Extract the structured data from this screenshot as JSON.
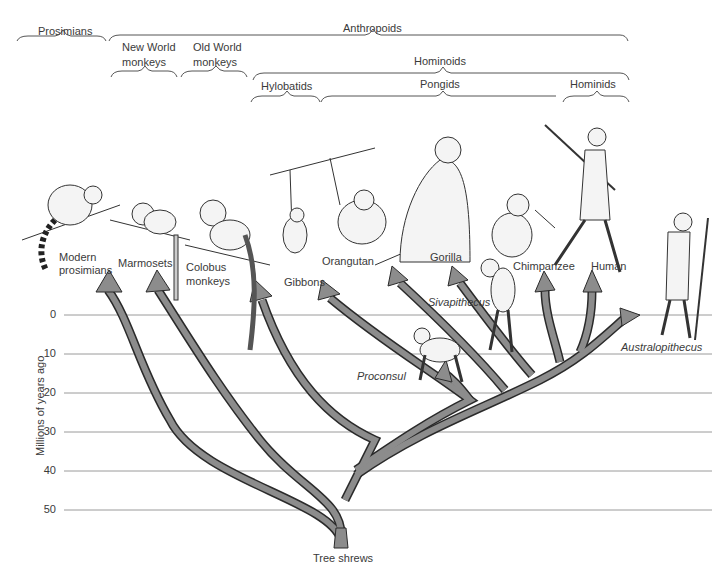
{
  "diagram": {
    "type": "phylogenetic-tree",
    "root_label": "Tree shrews",
    "axis": {
      "label": "Millions of years ago",
      "ticks": [
        "0",
        "10",
        "20",
        "30",
        "40",
        "50"
      ]
    },
    "groups": {
      "prosimians": "Prosimians",
      "anthropoids": "Anthropoids",
      "new_world_monkeys_line1": "New World",
      "new_world_monkeys_line2": "monkeys",
      "old_world_monkeys_line1": "Old World",
      "old_world_monkeys_line2": "monkeys",
      "hominoids": "Hominoids",
      "hylobatids": "Hylobatids",
      "pongids": "Pongids",
      "hominids": "Hominids"
    },
    "taxa": {
      "modern_prosimians_line1": "Modern",
      "modern_prosimians_line2": "prosimians",
      "marmosets": "Marmosets",
      "colobus_line1": "Colobus",
      "colobus_line2": "monkeys",
      "gibbons": "Gibbons",
      "orangutan": "Orangutan",
      "gorilla": "Gorilla",
      "chimpanzee": "Chimpanzee",
      "human": "Human"
    },
    "fossils": {
      "proconsul": "Proconsul",
      "sivapithecus": "Sivapithecus",
      "australopithecus": "Australopithecus"
    },
    "colors": {
      "branch_fill": "#8c8c8c",
      "branch_stroke": "#2a2a2a",
      "gridline": "#9a9a9a",
      "text": "#3a3a3a"
    }
  }
}
